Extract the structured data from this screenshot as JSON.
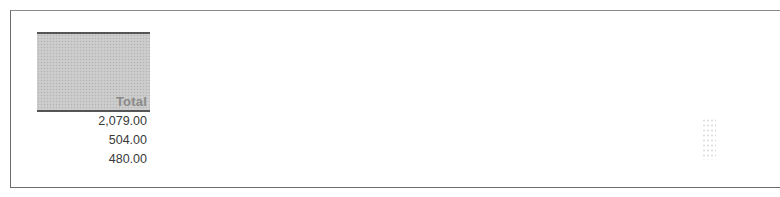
{
  "table": {
    "header": "Total",
    "rows": [
      {
        "value": "2,079.00"
      },
      {
        "value": "504.00"
      },
      {
        "value": "480.00"
      }
    ]
  },
  "colors": {
    "header_fill": "#c9c9c9",
    "header_text": "#8a8a8a",
    "rule": "#555555",
    "value_text": "#3a3a3a",
    "frame": "#6b6b6b"
  }
}
